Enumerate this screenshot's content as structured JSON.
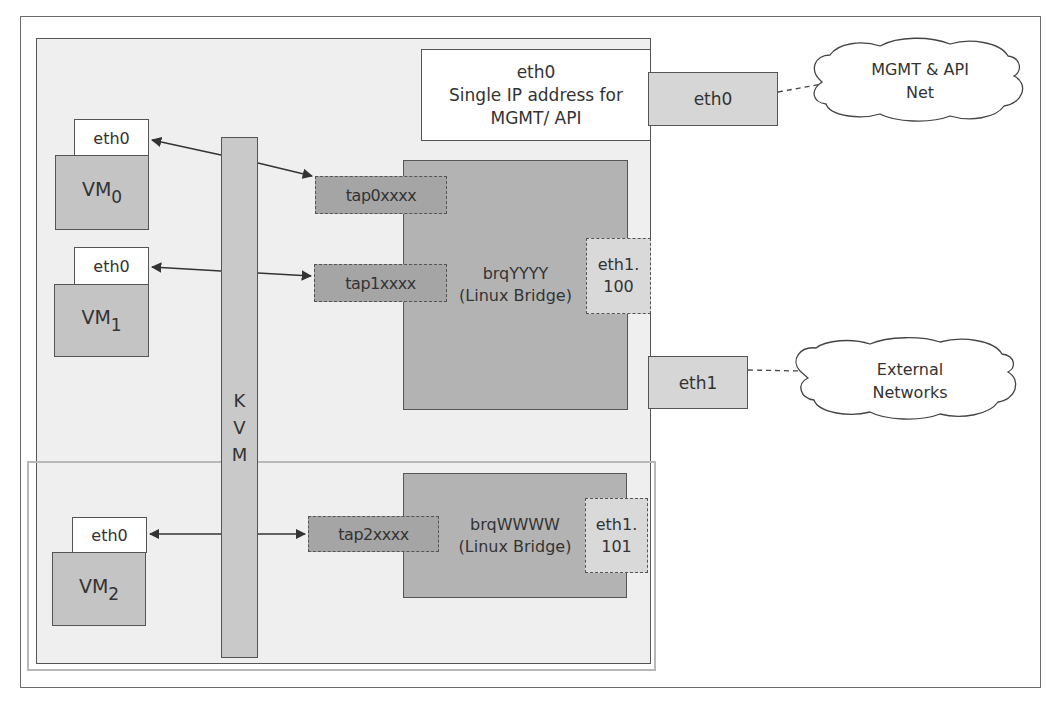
{
  "diagram": {
    "type": "network-architecture",
    "compute_host": {
      "management_interface": {
        "name": "eth0",
        "description_line1": "Single IP address for",
        "description_line2": "MGMT/ API"
      },
      "hypervisor": {
        "label_letters": [
          "K",
          "V",
          "M"
        ],
        "label": "KVM"
      },
      "vms": [
        {
          "id": "vm0",
          "name": "VM",
          "index": "0",
          "nic": "eth0",
          "tap": "tap0xxxx",
          "bridge": "brqYYYY"
        },
        {
          "id": "vm1",
          "name": "VM",
          "index": "1",
          "nic": "eth0",
          "tap": "tap1xxxx",
          "bridge": "brqYYYY"
        },
        {
          "id": "vm2",
          "name": "VM",
          "index": "2",
          "nic": "eth0",
          "tap": "tap2xxxx",
          "bridge": "brqWWWW"
        }
      ],
      "bridges": [
        {
          "id": "brqYYYY",
          "name": "brqYYYY",
          "type": "(Linux Bridge)",
          "vlan_if_line1": "eth1.",
          "vlan_if_line2": "100"
        },
        {
          "id": "brqWWWW",
          "name": "brqWWWW",
          "type": "(Linux Bridge)",
          "vlan_if_line1": "eth1.",
          "vlan_if_line2": "101"
        }
      ],
      "physical_nics": [
        {
          "name": "eth0",
          "network": "MGMT & API Net"
        },
        {
          "name": "eth1",
          "network": "External Networks"
        }
      ]
    },
    "networks": [
      {
        "id": "mgmt",
        "line1": "MGMT & API",
        "line2": "Net"
      },
      {
        "id": "external",
        "line1": "External",
        "line2": "Networks"
      }
    ],
    "colors": {
      "host_fill": "#efefef",
      "vm_fill": "#c4c4c4",
      "bridge_fill": "#b3b3b3",
      "tap_fill": "#a5a5a5",
      "vlan_fill": "#d9d9d9",
      "kvm_fill": "#c9c9c9",
      "nic_fill": "#d6d6d6",
      "border": "#555555"
    }
  }
}
